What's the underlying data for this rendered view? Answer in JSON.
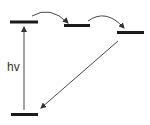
{
  "diagram": {
    "type": "energy-level-diagram",
    "colors": {
      "level": "#1a1a1a",
      "arrow": "#333333",
      "background": "#ffffff"
    },
    "levels": [
      {
        "id": "upper-level-1",
        "x1": 10,
        "x2": 38,
        "y": 22
      },
      {
        "id": "upper-level-2",
        "x1": 64,
        "x2": 90,
        "y": 25.5
      },
      {
        "id": "upper-level-3",
        "x1": 117,
        "x2": 144,
        "y": 32.5
      },
      {
        "id": "ground-level",
        "x1": 11,
        "x2": 38,
        "y": 114.5
      }
    ],
    "excitation": {
      "label": "hv",
      "x": 24,
      "y_from": 110,
      "y_to": 26
    },
    "transfer_arrows": [
      {
        "from": "upper-level-1",
        "to": "upper-level-2"
      },
      {
        "from": "upper-level-2",
        "to": "upper-level-3"
      }
    ],
    "relaxation_arrow": {
      "from": "upper-level-3",
      "to": "ground-level"
    }
  }
}
